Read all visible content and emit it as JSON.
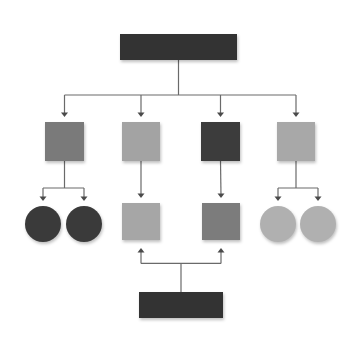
{
  "diagram": {
    "type": "hierarchy-flow",
    "background": "#ffffff",
    "line_color": "#6a6a6a",
    "nodes": [
      {
        "id": "top-root",
        "shape": "rect",
        "x": 120,
        "y": 34,
        "w": 117,
        "h": 26,
        "color": "#333333"
      },
      {
        "id": "level1-a",
        "shape": "rect",
        "x": 45,
        "y": 122,
        "w": 39,
        "h": 39,
        "color": "#7a7a7a"
      },
      {
        "id": "level1-b",
        "shape": "rect",
        "x": 122,
        "y": 122,
        "w": 38,
        "h": 39,
        "color": "#a3a3a3"
      },
      {
        "id": "level1-c",
        "shape": "rect",
        "x": 201,
        "y": 122,
        "w": 39,
        "h": 39,
        "color": "#3c3c3c"
      },
      {
        "id": "level1-d",
        "shape": "rect",
        "x": 277,
        "y": 122,
        "w": 38,
        "h": 39,
        "color": "#a8a8a8"
      },
      {
        "id": "level2-a1",
        "shape": "circle",
        "cx": 43,
        "cy": 224,
        "r": 18,
        "color": "#3a3a3a"
      },
      {
        "id": "level2-a2",
        "shape": "circle",
        "cx": 84,
        "cy": 224,
        "r": 18,
        "color": "#3a3a3a"
      },
      {
        "id": "level2-b",
        "shape": "rect",
        "x": 122,
        "y": 203,
        "w": 38,
        "h": 37,
        "color": "#a6a6a6"
      },
      {
        "id": "level2-c",
        "shape": "rect",
        "x": 202,
        "y": 203,
        "w": 38,
        "h": 37,
        "color": "#7c7c7c"
      },
      {
        "id": "level2-d1",
        "shape": "circle",
        "cx": 278,
        "cy": 224,
        "r": 18,
        "color": "#b0b0b0"
      },
      {
        "id": "level2-d2",
        "shape": "circle",
        "cx": 318,
        "cy": 224,
        "r": 18,
        "color": "#b0b0b0"
      },
      {
        "id": "bottom-root",
        "shape": "rect",
        "x": 139,
        "y": 292,
        "w": 84,
        "h": 26,
        "color": "#333333"
      }
    ],
    "edges": [
      {
        "from": "top-root",
        "to": "level1-a",
        "direction": "down"
      },
      {
        "from": "top-root",
        "to": "level1-b",
        "direction": "down"
      },
      {
        "from": "top-root",
        "to": "level1-c",
        "direction": "down"
      },
      {
        "from": "top-root",
        "to": "level1-d",
        "direction": "down"
      },
      {
        "from": "level1-a",
        "to": "level2-a1",
        "direction": "down"
      },
      {
        "from": "level1-a",
        "to": "level2-a2",
        "direction": "down"
      },
      {
        "from": "level1-b",
        "to": "level2-b",
        "direction": "down"
      },
      {
        "from": "level1-c",
        "to": "level2-c",
        "direction": "down"
      },
      {
        "from": "level1-d",
        "to": "level2-d1",
        "direction": "down"
      },
      {
        "from": "level1-d",
        "to": "level2-d2",
        "direction": "down"
      },
      {
        "from": "bottom-root",
        "to": "level2-b",
        "direction": "up"
      },
      {
        "from": "bottom-root",
        "to": "level2-c",
        "direction": "up"
      }
    ]
  }
}
